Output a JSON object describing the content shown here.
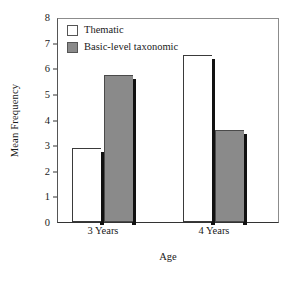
{
  "chart_data": {
    "type": "bar",
    "title": "",
    "xlabel": "Age",
    "ylabel": "Mean Frequency",
    "categories": [
      "3 Years",
      "4 Years"
    ],
    "series": [
      {
        "name": "Thematic",
        "values": [
          2.9,
          6.5
        ],
        "color": "#ffffff"
      },
      {
        "name": "Basic-level taxonomic",
        "values": [
          5.75,
          3.6
        ],
        "color": "#8a8a8a"
      }
    ],
    "ylim": [
      0,
      8
    ],
    "yticks": [
      0,
      1,
      2,
      3,
      4,
      5,
      6,
      7,
      8
    ],
    "ytick_labels": [
      "0",
      "1",
      "2",
      "3",
      "4",
      "5",
      "6",
      "7",
      "8"
    ],
    "grid": false,
    "legend_position": "top-left",
    "frame": "box"
  },
  "legend": {
    "items": [
      {
        "label": "Thematic",
        "swatch": "white"
      },
      {
        "label": "Basic-level taxonomic",
        "swatch": "gray"
      }
    ]
  },
  "colors": {
    "bar_thematic": "#ffffff",
    "bar_taxonomic": "#8a8a8a",
    "bar_outline": "#3a3a3a",
    "bar_shadow": "#111111",
    "axis": "#333333",
    "frame": "#8c8c8c",
    "text": "#1a1a1a",
    "background": "#ffffff"
  }
}
